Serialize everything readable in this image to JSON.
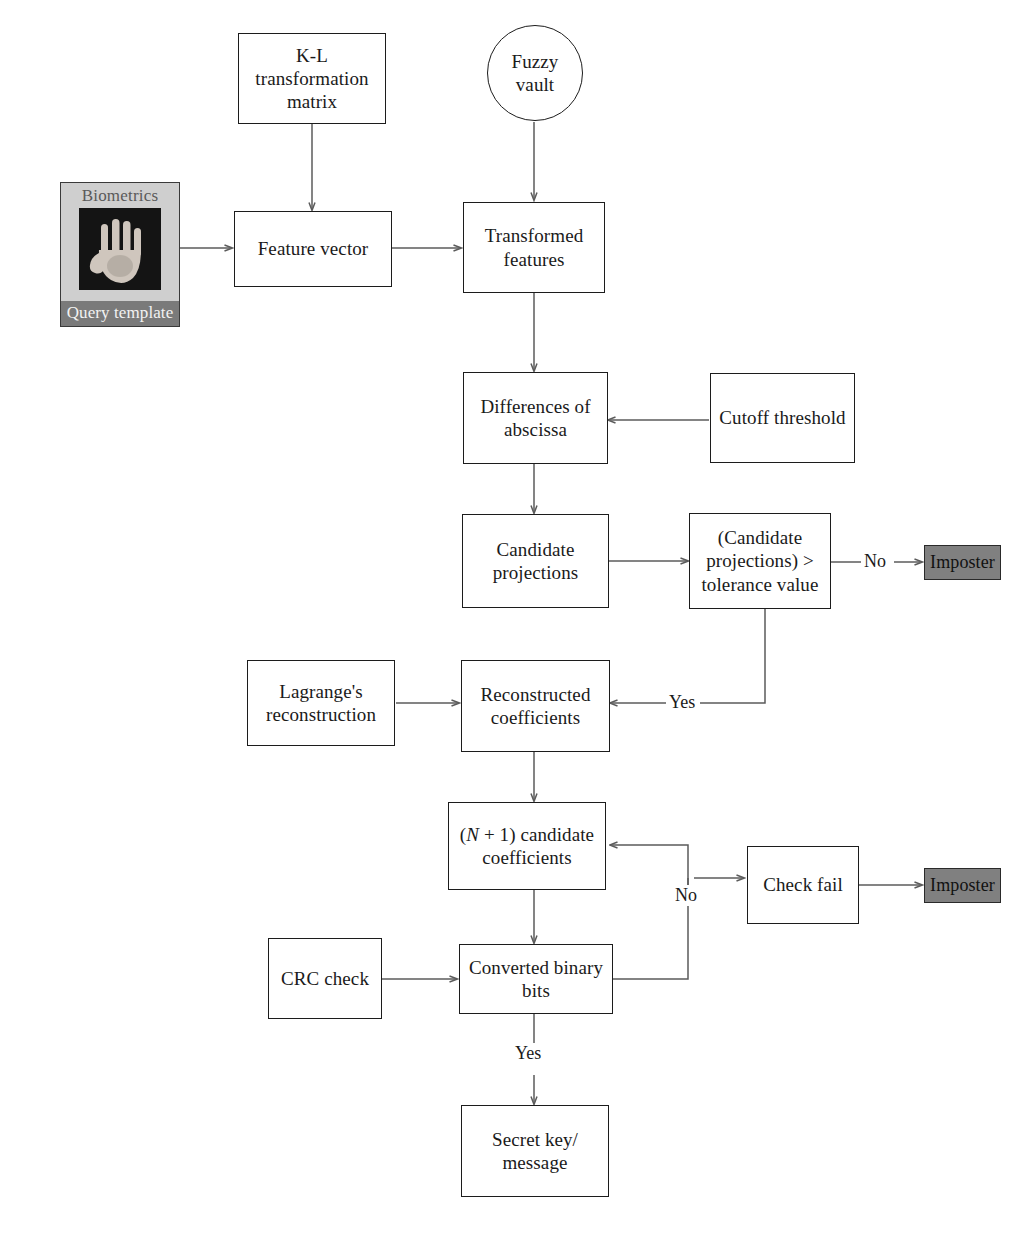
{
  "diagram": {
    "accent_shaded": "#808080",
    "line_color": "#5b5b5b",
    "box_border": "#1c1c1c"
  },
  "nodes": {
    "kl_matrix": {
      "label": "K-L\ntransformation\nmatrix"
    },
    "fuzzy_vault": {
      "label": "Fuzzy\nvault"
    },
    "biometrics": {
      "title": "Biometrics",
      "caption": "Query template",
      "image": "hand-biometric-image"
    },
    "feature_vector": {
      "label": "Feature vector"
    },
    "transformed_features": {
      "label": "Transformed\nfeatures"
    },
    "differences_abscissa": {
      "label": "Differences of\nabscissa"
    },
    "cutoff_threshold": {
      "label": "Cutoff threshold"
    },
    "candidate_projections": {
      "label": "Candidate\nprojections"
    },
    "tolerance_decision": {
      "label": "(Candidate\nprojections) >\ntolerance value"
    },
    "imposter_top": {
      "label": "Imposter"
    },
    "lagrange": {
      "label": "Lagrange's\nreconstruction"
    },
    "reconstructed_coefficients": {
      "label": "Reconstructed\ncoefficients"
    },
    "n_plus_one": {
      "label_prefix": "(",
      "label_italic": "N",
      "label_suffix": " + 1) candidate\ncoefficients"
    },
    "check_fail": {
      "label": "Check fail"
    },
    "imposter_bottom": {
      "label": "Imposter"
    },
    "crc_check": {
      "label": "CRC check"
    },
    "converted_binary_bits": {
      "label": "Converted binary\nbits"
    },
    "secret_key": {
      "label": "Secret key/\nmessage"
    }
  },
  "edge_labels": {
    "no_tolerance": "No",
    "yes_tolerance": "Yes",
    "no_crc": "No",
    "yes_crc": "Yes"
  }
}
